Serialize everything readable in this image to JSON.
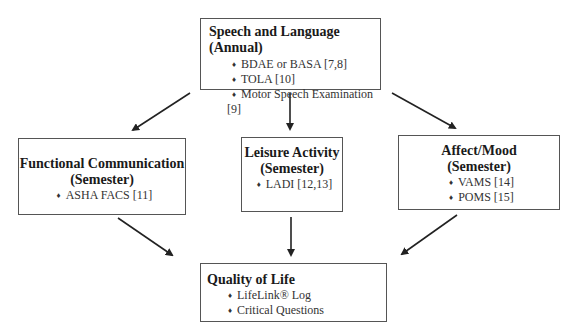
{
  "diagram": {
    "nodes": {
      "speech": {
        "title": "Speech and Language (Annual)",
        "items": [
          "BDAE or BASA  [7,8]",
          "TOLA  [10]",
          "Motor Speech Examination  [9]"
        ]
      },
      "functional": {
        "title_line1": "Functional Communication",
        "title_line2": "(Semester)",
        "items": [
          "ASHA FACS  [11]"
        ]
      },
      "leisure": {
        "title_line1": "Leisure Activity",
        "title_line2": "(Semester)",
        "items": [
          "LADI  [12,13]"
        ]
      },
      "affect": {
        "title_line1": "Affect/Mood",
        "title_line2": "(Semester)",
        "items": [
          "VAMS  [14]",
          "POMS  [15]"
        ]
      },
      "quality": {
        "title": "Quality of Life",
        "items": [
          "LifeLink® Log",
          "Critical Questions"
        ]
      }
    },
    "bullet_glyph": "♦",
    "edges": [
      {
        "from": "speech",
        "to": "functional"
      },
      {
        "from": "speech",
        "to": "leisure"
      },
      {
        "from": "speech",
        "to": "affect"
      },
      {
        "from": "functional",
        "to": "quality"
      },
      {
        "from": "leisure",
        "to": "quality"
      },
      {
        "from": "affect",
        "to": "quality"
      }
    ]
  }
}
